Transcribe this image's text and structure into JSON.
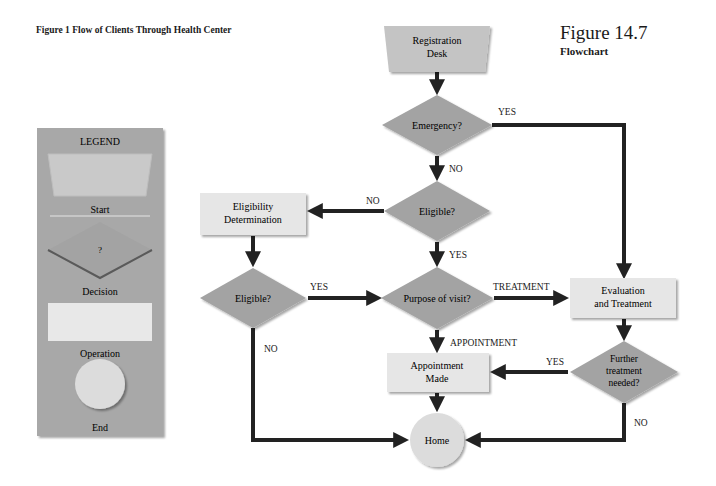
{
  "figure": {
    "title": "Figure 1 Flow of Clients Through Health Center",
    "number": "Figure 14.7",
    "subtitle": "Flowchart"
  },
  "legend": {
    "heading": "LEGEND",
    "items": [
      {
        "shape": "trapezoid",
        "label": "Start"
      },
      {
        "shape": "diamond",
        "symbol": "?",
        "label": "Decision"
      },
      {
        "shape": "rectangle",
        "label": "Operation"
      },
      {
        "shape": "circle",
        "label": "End"
      }
    ]
  },
  "colors": {
    "decision_fill": "#a3a3a3",
    "operation_fill": "#e6e6e6",
    "start_fill": "#c4c4c4",
    "end_fill": "#dcdcdc",
    "legend_bg": "#a8a8a8",
    "arrow": "#222222"
  },
  "nodes": {
    "registration": {
      "type": "start",
      "line1": "Registration",
      "line2": "Desk"
    },
    "emergency": {
      "type": "decision",
      "label": "Emergency?"
    },
    "eligible_main": {
      "type": "decision",
      "label": "Eligible?"
    },
    "eligibility_det": {
      "type": "operation",
      "line1": "Eligibility",
      "line2": "Determination"
    },
    "eligible_left": {
      "type": "decision",
      "label": "Eligible?"
    },
    "purpose": {
      "type": "decision",
      "label": "Purpose of visit?"
    },
    "evaluation": {
      "type": "operation",
      "line1": "Evaluation",
      "line2": "and Treatment"
    },
    "further": {
      "type": "decision",
      "line1": "Further",
      "line2": "treatment",
      "line3": "needed?"
    },
    "appointment": {
      "type": "operation",
      "line1": "Appointment",
      "line2": "Made"
    },
    "home": {
      "type": "end",
      "label": "Home"
    }
  },
  "edges": {
    "emergency_yes": "YES",
    "emergency_no": "NO",
    "eligible_main_no": "NO",
    "eligible_main_yes": "YES",
    "eligible_left_yes": "YES",
    "eligible_left_no": "NO",
    "purpose_treatment": "TREATMENT",
    "purpose_appointment": "APPOINTMENT",
    "further_yes": "YES",
    "further_no": "NO"
  }
}
